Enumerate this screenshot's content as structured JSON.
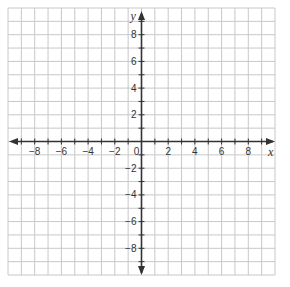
{
  "diagram": {
    "type": "coordinate-plane",
    "x_axis": {
      "label": "x",
      "min": -10,
      "max": 10,
      "tick_labels": [
        "-8",
        "-6",
        "-4",
        "-2",
        "0",
        "2",
        "4",
        "6",
        "8"
      ],
      "tick_values": [
        -8,
        -6,
        -4,
        -2,
        0,
        2,
        4,
        6,
        8
      ]
    },
    "y_axis": {
      "label": "y",
      "min": -10,
      "max": 10,
      "tick_labels": [
        "8",
        "6",
        "4",
        "2",
        "-2",
        "-4",
        "-6",
        "-8"
      ],
      "tick_values": [
        8,
        6,
        4,
        2,
        -2,
        -4,
        -6,
        -8
      ]
    },
    "grid": {
      "cells_x": 20,
      "cells_y": 20,
      "unit": 1
    },
    "colors": {
      "grid": "#c8c8c8",
      "axis": "#333333",
      "background": "#ffffff"
    }
  }
}
